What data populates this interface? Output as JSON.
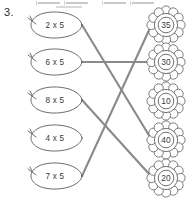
{
  "worksheet": {
    "question_number": "3.",
    "instruction_visible": false,
    "left_column": {
      "shape": "leaf",
      "items": [
        {
          "label": "2 x 5",
          "cx": 55,
          "cy": 25,
          "tip_x": 82,
          "tip_y": 25
        },
        {
          "label": "6 x 5",
          "cx": 55,
          "cy": 62,
          "tip_x": 82,
          "tip_y": 62
        },
        {
          "label": "8 x 5",
          "cx": 55,
          "cy": 100,
          "tip_x": 82,
          "tip_y": 100
        },
        {
          "label": "4 x 5",
          "cx": 55,
          "cy": 138,
          "tip_x": 82,
          "tip_y": 138
        },
        {
          "label": "7 x 5",
          "cx": 55,
          "cy": 176,
          "tip_x": 82,
          "tip_y": 176
        }
      ]
    },
    "right_column": {
      "shape": "flower",
      "items": [
        {
          "label": "35",
          "cx": 166,
          "cy": 25,
          "anchor_x": 150,
          "anchor_y": 28
        },
        {
          "label": "30",
          "cx": 166,
          "cy": 62,
          "anchor_x": 150,
          "anchor_y": 62
        },
        {
          "label": "10",
          "cx": 166,
          "cy": 101,
          "anchor_x": 150,
          "anchor_y": 104
        },
        {
          "label": "40",
          "cx": 166,
          "cy": 140,
          "anchor_x": 150,
          "anchor_y": 137
        },
        {
          "label": "20",
          "cx": 166,
          "cy": 178,
          "anchor_x": 150,
          "anchor_y": 175
        }
      ]
    },
    "connections": [
      {
        "from_label": "2 x 5",
        "to_label": "40",
        "x1": 82,
        "y1": 25,
        "x2": 150,
        "y2": 137
      },
      {
        "from_label": "6 x 5",
        "to_label": "30",
        "x1": 82,
        "y1": 62,
        "x2": 150,
        "y2": 62
      },
      {
        "from_label": "8 x 5",
        "to_label": "20",
        "x1": 82,
        "y1": 100,
        "x2": 150,
        "y2": 175
      },
      {
        "from_label": "7 x 5",
        "to_label": "35",
        "x1": 82,
        "y1": 176,
        "x2": 150,
        "y2": 28
      }
    ],
    "unconnected_left": [
      "4 x 5"
    ],
    "unconnected_right": [
      "10"
    ],
    "colors": {
      "line": "#8a8a8a",
      "outline": "#5c5c5c",
      "text": "#3a3a3a",
      "background": "#ffffff"
    }
  }
}
